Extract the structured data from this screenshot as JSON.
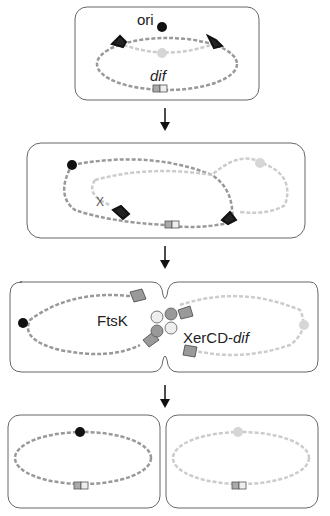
{
  "diagram": {
    "type": "chromosome segregation schematic",
    "panels": [
      {
        "id": 1,
        "labels": {
          "ori": "ori",
          "dif": "dif"
        }
      },
      {
        "id": 2,
        "labels": {
          "crossover": "X"
        }
      },
      {
        "id": 3,
        "labels": {
          "ftsk": "FtsK",
          "xercd": "XerCD-",
          "xercd_dif": "dif"
        }
      },
      {
        "id": 4,
        "labels": {}
      },
      {
        "id": 5,
        "labels": {}
      }
    ],
    "colors": {
      "dark_dna": "#8a8a8a",
      "light_dna": "#cfcfcf",
      "ori_dark": "#111111",
      "ori_light": "#d6d6d6",
      "outline": "#555555",
      "ftsk_fill": "#9a9a9a",
      "dif_dark": "#aaaaaa"
    },
    "arrows": 3
  }
}
